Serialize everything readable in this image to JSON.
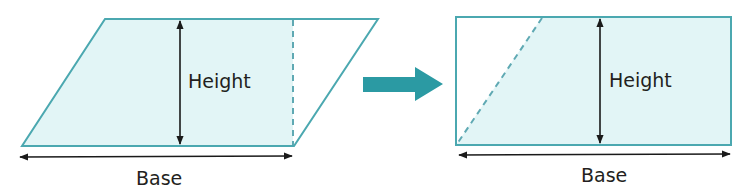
{
  "colors": {
    "fill": "#e2f5f6",
    "outline": "#4ba8b0",
    "dashed": "#5fa9b3",
    "transform_arrow": "#2b9aa3",
    "dimension": "#1a1a1a",
    "text": "#231f20"
  },
  "left_figure": {
    "shape": "parallelogram",
    "height_label": "Height",
    "base_label": "Base"
  },
  "transform_arrow": {
    "icon": "right-arrow-icon"
  },
  "right_figure": {
    "shape": "rectangle",
    "height_label": "Height",
    "base_label": "Base"
  }
}
